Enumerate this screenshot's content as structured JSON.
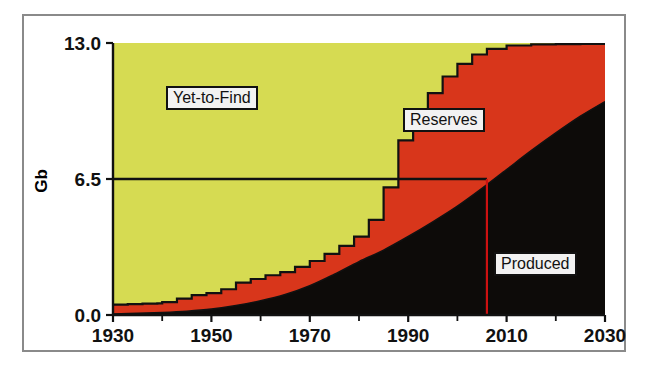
{
  "figure": {
    "background_color": "#ffffff",
    "frame_color": "#8a8a8a"
  },
  "chart_data": {
    "type": "area",
    "title": "",
    "subtitle": "",
    "xlabel": "",
    "ylabel": "Gb",
    "xlim": [
      1930,
      2030
    ],
    "ylim": [
      0.0,
      13.0
    ],
    "grid": false,
    "legend_position": "inline-annotations",
    "stacked": true,
    "stack_order_bottom_to_top": [
      "Produced",
      "Reserves",
      "Yet-to-Find"
    ],
    "x_tick_labels": [
      "1930",
      "1950",
      "1970",
      "1990",
      "2010",
      "2030"
    ],
    "x_tick_values": [
      1930,
      1950,
      1970,
      1990,
      2010,
      2030
    ],
    "x_minor_tick_values": [
      1940,
      1960,
      1980,
      2000,
      2020
    ],
    "y_tick_labels": [
      "0.0",
      "6.5",
      "13.0"
    ],
    "y_tick_values": [
      0.0,
      6.5,
      13.0
    ],
    "colors": {
      "produced": "#0d0b09",
      "reserves": "#d8361b",
      "yet_to_find": "#d6db52",
      "outline": "#111111",
      "marker_line": "#cc1111"
    },
    "annotations": [
      {
        "name": "yet-to-find-label",
        "text": "Yet-to-Find",
        "x": 1952,
        "y": 10.3
      },
      {
        "name": "reserves-label",
        "text": "Reserves",
        "x": 1994,
        "y": 8.7
      },
      {
        "name": "produced-label",
        "text": "Produced",
        "x": 2016,
        "y": 3.3
      },
      {
        "name": "midpoint-marker",
        "text": "",
        "x": 2006,
        "y": 6.5
      }
    ],
    "reference_lines": [
      {
        "name": "half-depletion-horizontal",
        "orientation": "horizontal",
        "value": 6.5,
        "x_start": 1930,
        "x_end": 2006,
        "color": "#111111"
      },
      {
        "name": "half-depletion-vertical",
        "orientation": "vertical",
        "value": 2006,
        "y_start": 0.0,
        "y_end": 6.5,
        "color": "#cc1111"
      }
    ],
    "series": [
      {
        "name": "Produced",
        "color": "#0d0b09",
        "x": [
          1930,
          1935,
          1940,
          1945,
          1950,
          1955,
          1960,
          1965,
          1970,
          1975,
          1980,
          1985,
          1990,
          1995,
          2000,
          2005,
          2010,
          2015,
          2020,
          2025,
          2030
        ],
        "values": [
          0.05,
          0.08,
          0.12,
          0.18,
          0.28,
          0.45,
          0.68,
          0.98,
          1.4,
          1.95,
          2.55,
          3.1,
          3.75,
          4.45,
          5.2,
          6.05,
          6.95,
          7.85,
          8.7,
          9.5,
          10.2
        ]
      },
      {
        "name": "Reserves",
        "color": "#d8361b",
        "x": [
          1930,
          1935,
          1940,
          1945,
          1950,
          1955,
          1960,
          1965,
          1970,
          1975,
          1980,
          1985,
          1990,
          1995,
          2000,
          2005,
          2010,
          2015,
          2020,
          2025,
          2030
        ],
        "values": [
          0.45,
          0.45,
          0.5,
          0.62,
          0.95,
          1.1,
          1.35,
          1.75,
          2.2,
          2.8,
          3.95,
          5.5,
          6.45,
          6.95,
          7.0,
          6.8,
          6.25,
          5.5,
          4.55,
          3.6,
          2.8
        ]
      },
      {
        "name": "Yet-to-Find",
        "color": "#d6db52",
        "x": [
          1930,
          1935,
          1940,
          1945,
          1950,
          1955,
          1960,
          1965,
          1970,
          1975,
          1980,
          1985,
          1990,
          1995,
          2000,
          2005,
          2010,
          2015,
          2020,
          2025,
          2030
        ],
        "values": [
          12.5,
          12.47,
          12.38,
          12.2,
          11.77,
          11.45,
          10.97,
          10.27,
          9.4,
          8.25,
          6.5,
          4.4,
          2.8,
          1.6,
          0.8,
          0.15,
          0.05,
          0.05,
          0.05,
          0.05,
          0.0
        ]
      }
    ],
    "cumulative_totals": {
      "produced_plus_reserves_x": [
        1930,
        1933,
        1936,
        1939,
        1940,
        1943,
        1946,
        1949,
        1952,
        1955,
        1958,
        1961,
        1964,
        1967,
        1970,
        1973,
        1976,
        1979,
        1982,
        1985,
        1988,
        1991,
        1994,
        1997,
        2000,
        2003,
        2006,
        2010,
        2015,
        2020,
        2025,
        2030
      ],
      "produced_plus_reserves_y": [
        0.5,
        0.52,
        0.54,
        0.56,
        0.62,
        0.78,
        0.95,
        1.05,
        1.23,
        1.55,
        1.72,
        1.9,
        2.05,
        2.3,
        2.58,
        2.92,
        3.3,
        3.75,
        4.55,
        6.1,
        8.35,
        9.7,
        10.6,
        11.4,
        12.0,
        12.45,
        12.72,
        12.88,
        12.93,
        12.95,
        12.96,
        12.97
      ]
    }
  },
  "labels": {
    "y_axis_title": "Gb",
    "yet_to_find": "Yet-to-Find",
    "reserves": "Reserves",
    "produced": "Produced",
    "y_top": "13.0",
    "y_mid": "6.5",
    "y_bottom": "0.0",
    "x_1930": "1930",
    "x_1950": "1950",
    "x_1970": "1970",
    "x_1990": "1990",
    "x_2010": "2010",
    "x_2030": "2030"
  }
}
